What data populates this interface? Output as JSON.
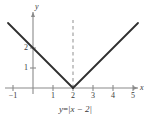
{
  "figure": {
    "caption_prefix": "y",
    "caption_equals": "=",
    "caption_expr": "|x − 2|",
    "caption_full": "y = |x − 2|",
    "background_color": "#ffffff",
    "curve_color": "#2f2f2f",
    "axis_color": "#8a8a8a",
    "dashed_color": "#9a9a9a",
    "text_color": "#3a3a3a"
  },
  "axes": {
    "x_axis_label": "x",
    "y_axis_label": "y",
    "x_ticks": [
      {
        "value": -1,
        "label": "−1",
        "px": 13
      },
      {
        "value": 1,
        "label": "1",
        "px": 53
      },
      {
        "value": 2,
        "label": "2",
        "px": 73
      },
      {
        "value": 3,
        "label": "3",
        "px": 93
      },
      {
        "value": 4,
        "label": "4",
        "px": 113
      },
      {
        "value": 5,
        "label": "5",
        "px": 133
      }
    ],
    "y_ticks": [
      {
        "value": 1,
        "label": "1",
        "px": 68
      },
      {
        "value": 2,
        "label": "2",
        "px": 48
      }
    ],
    "origin_px": {
      "x": 33,
      "y": 88
    },
    "unit_px": 20,
    "xlim": [
      -1.6,
      5.9
    ],
    "ylim": [
      -0.6,
      3.6
    ]
  },
  "chart_data": {
    "type": "line",
    "title": "",
    "subtitle": "",
    "xlabel": "x",
    "ylabel": "y",
    "xlim": [
      -1.6,
      5.9
    ],
    "ylim": [
      -0.6,
      3.6
    ],
    "grid": false,
    "legend": false,
    "function": "y = |x - 2|",
    "vertex": {
      "x": 2,
      "y": 0
    },
    "y_intercept": {
      "x": 0,
      "y": 2
    },
    "xtick_labels": [
      "−1",
      "1",
      "2",
      "3",
      "4",
      "5"
    ],
    "xtick_values": [
      -1,
      1,
      2,
      3,
      4,
      5
    ],
    "ytick_labels": [
      "1",
      "2"
    ],
    "ytick_values": [
      1,
      2
    ],
    "series": [
      {
        "name": "y = |x - 2|",
        "color": "#2f2f2f",
        "style": "solid",
        "points": [
          {
            "x": -1.25,
            "y": 3.25
          },
          {
            "x": -1,
            "y": 3
          },
          {
            "x": 0,
            "y": 2
          },
          {
            "x": 1,
            "y": 1
          },
          {
            "x": 2,
            "y": 0
          },
          {
            "x": 3,
            "y": 1
          },
          {
            "x": 4,
            "y": 2
          },
          {
            "x": 5,
            "y": 3
          },
          {
            "x": 5.25,
            "y": 3.25
          }
        ]
      }
    ],
    "annotations": [
      {
        "type": "vertical-dashed-line",
        "name": "axis-of-symmetry",
        "x": 2,
        "y_from": 0,
        "y_to": 3.4,
        "color": "#9a9a9a"
      }
    ]
  }
}
